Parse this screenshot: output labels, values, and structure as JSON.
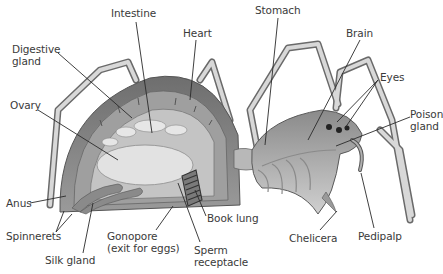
{
  "diagram": {
    "labels": [
      {
        "id": "intestine",
        "text": "Intestine",
        "x": 111,
        "y": 7,
        "lines": [
          [
            136,
            22,
            152,
            133
          ]
        ]
      },
      {
        "id": "heart",
        "text": "Heart",
        "x": 183,
        "y": 27,
        "lines": [
          [
            196,
            40,
            190,
            100
          ]
        ]
      },
      {
        "id": "digestive-gland",
        "text": "Digestive\ngland",
        "x": 12,
        "y": 43,
        "lines": [
          [
            58,
            53,
            132,
            118
          ]
        ]
      },
      {
        "id": "ovary",
        "text": "Ovary",
        "x": 10,
        "y": 99,
        "lines": [
          [
            38,
            110,
            118,
            160
          ]
        ]
      },
      {
        "id": "stomach",
        "text": "Stomach",
        "x": 255,
        "y": 4,
        "lines": [
          [
            278,
            18,
            265,
            145
          ]
        ]
      },
      {
        "id": "brain",
        "text": "Brain",
        "x": 346,
        "y": 27,
        "lines": [
          [
            360,
            40,
            308,
            140
          ]
        ]
      },
      {
        "id": "eyes",
        "text": "Eyes",
        "x": 380,
        "y": 71,
        "lines": [
          [
            378,
            80,
            337,
            122
          ],
          [
            378,
            80,
            345,
            128
          ]
        ]
      },
      {
        "id": "poison-gland",
        "text": "Poison\ngland",
        "x": 410,
        "y": 108,
        "lines": [
          [
            410,
            117,
            336,
            146
          ]
        ]
      },
      {
        "id": "anus",
        "text": "Anus",
        "x": 6,
        "y": 197,
        "lines": [
          [
            30,
            203,
            66,
            196
          ]
        ]
      },
      {
        "id": "spinnerets",
        "text": "Spinnerets",
        "x": 6,
        "y": 230,
        "lines": [
          [
            56,
            232,
            64,
            211
          ],
          [
            56,
            232,
            72,
            214
          ]
        ]
      },
      {
        "id": "silk-gland",
        "text": "Silk gland",
        "x": 45,
        "y": 254,
        "lines": [
          [
            83,
            253,
            93,
            203
          ]
        ]
      },
      {
        "id": "gonopore",
        "text": "Gonopore\n(exit for eggs)",
        "x": 107,
        "y": 230,
        "lines": [
          [
            156,
            230,
            173,
            206
          ]
        ]
      },
      {
        "id": "book-lung",
        "text": "Book lung",
        "x": 207,
        "y": 212,
        "lines": [
          [
            206,
            216,
            195,
            190
          ]
        ]
      },
      {
        "id": "sperm-receptacle",
        "text": "Sperm\nreceptacle",
        "x": 194,
        "y": 244,
        "lines": [
          [
            200,
            242,
            178,
            183
          ]
        ]
      },
      {
        "id": "chelicera",
        "text": "Chelicera",
        "x": 289,
        "y": 232,
        "lines": [
          [
            320,
            230,
            337,
            211
          ]
        ]
      },
      {
        "id": "pedipalp",
        "text": "Pedipalp",
        "x": 358,
        "y": 230,
        "lines": [
          [
            374,
            228,
            361,
            173
          ]
        ]
      }
    ]
  },
  "colors": {
    "outline": "#5a5a5a",
    "body_dark": "#7d7d7d",
    "body_mid": "#a9a9a9",
    "body_light": "#d6d6d6",
    "highlight": "#ececec",
    "label_text": "#3a3a3a",
    "leader": "#2a2a2a"
  }
}
